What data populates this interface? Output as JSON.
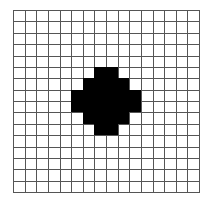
{
  "grid": {
    "rows": 16,
    "cols": 16,
    "colors": {
      "filled": "#000000",
      "empty": "#ffffff",
      "line": "#555555"
    },
    "filled_cells": [
      [
        5,
        7
      ],
      [
        5,
        8
      ],
      [
        6,
        6
      ],
      [
        6,
        7
      ],
      [
        6,
        8
      ],
      [
        6,
        9
      ],
      [
        7,
        5
      ],
      [
        7,
        6
      ],
      [
        7,
        7
      ],
      [
        7,
        8
      ],
      [
        7,
        9
      ],
      [
        7,
        10
      ],
      [
        8,
        5
      ],
      [
        8,
        6
      ],
      [
        8,
        7
      ],
      [
        8,
        8
      ],
      [
        8,
        9
      ],
      [
        8,
        10
      ],
      [
        9,
        6
      ],
      [
        9,
        7
      ],
      [
        9,
        8
      ],
      [
        9,
        9
      ],
      [
        10,
        7
      ],
      [
        10,
        8
      ]
    ]
  }
}
